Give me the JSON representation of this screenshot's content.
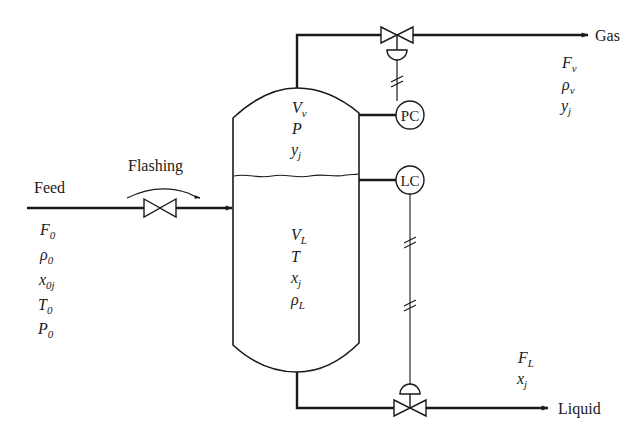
{
  "diagram": {
    "colors": {
      "line": "#1a1a1a",
      "background": "#ffffff"
    },
    "streams": {
      "feed": {
        "label": "Feed",
        "valve_label": "Flashing",
        "variables": [
          {
            "sym": "F",
            "sub": "0",
            "sub_italic": false
          },
          {
            "sym": "ρ",
            "sub": "0",
            "sub_italic": false
          },
          {
            "sym": "x",
            "sub": "0j",
            "sub_italic": true
          },
          {
            "sym": "T",
            "sub": "0",
            "sub_italic": false
          },
          {
            "sym": "P",
            "sub": "0",
            "sub_italic": false
          }
        ]
      },
      "gas": {
        "label": "Gas",
        "variables": [
          {
            "sym": "F",
            "sub": "v",
            "sub_italic": true
          },
          {
            "sym": "ρ",
            "sub": "v",
            "sub_italic": true
          },
          {
            "sym": "y",
            "sub": "j",
            "sub_italic": true
          }
        ]
      },
      "liquid": {
        "label": "Liquid",
        "variables": [
          {
            "sym": "F",
            "sub": "L",
            "sub_italic": true
          },
          {
            "sym": "x",
            "sub": "j",
            "sub_italic": true
          }
        ]
      }
    },
    "vessel": {
      "vapor_phase": [
        {
          "sym": "V",
          "sub": "v"
        },
        {
          "sym": "P",
          "sub": ""
        },
        {
          "sym": "y",
          "sub": "j"
        }
      ],
      "liquid_phase": [
        {
          "sym": "V",
          "sub": "L"
        },
        {
          "sym": "T",
          "sub": ""
        },
        {
          "sym": "x",
          "sub": "j"
        },
        {
          "sym": "ρ",
          "sub": "L"
        }
      ]
    },
    "controllers": {
      "pressure": {
        "label": "PC"
      },
      "level": {
        "label": "LC"
      }
    }
  }
}
